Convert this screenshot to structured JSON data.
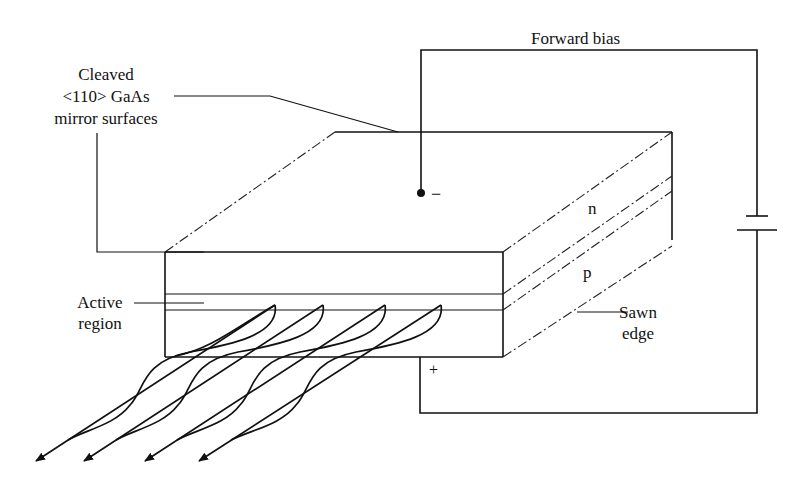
{
  "figure": {
    "labels": {
      "forward_bias": "Forward bias",
      "mirror_line1": "Cleaved",
      "mirror_line2": "<110> GaAs",
      "mirror_line3": "mirror surfaces",
      "active_line1": "Active",
      "active_line2": "region",
      "sawn_line1": "Sawn",
      "sawn_line2": "edge",
      "n_layer": "n",
      "p_layer": "p",
      "minus": "−",
      "plus": "+"
    },
    "components": {
      "block": "GaAs chip with n and p layers",
      "battery": "battery-symbol",
      "beams": 4
    },
    "colors": {
      "ink": "#111111",
      "background": "#ffffff"
    }
  }
}
